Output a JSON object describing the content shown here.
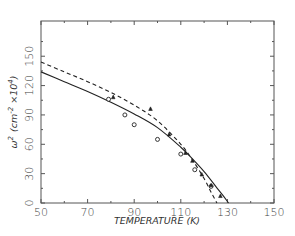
{
  "chart_data": {
    "type": "line",
    "title": "",
    "xlabel": "TEMPERATURE (K)",
    "ylabel": "ω² (cm⁻² ×10⁴)",
    "ylabel_parts": {
      "symbol": "ω",
      "symbol_sup": "2",
      "unit_open": "(cm",
      "unit_sup": "-2",
      "unit_mult": " ×10",
      "unit_mult_sup": "4",
      "unit_close": ")"
    },
    "xlim": [
      50,
      150
    ],
    "ylim": [
      0,
      186
    ],
    "xticks": [
      50,
      70,
      90,
      110,
      130,
      150
    ],
    "xtick_labels": [
      "50",
      "70",
      "90",
      "110",
      "130",
      "150"
    ],
    "xminor_ticks": [
      60,
      80,
      100,
      120,
      140
    ],
    "yticks": [
      0,
      30,
      60,
      90,
      120,
      150
    ],
    "ytick_labels": [
      "0",
      "30",
      "60",
      "90",
      "120",
      "150"
    ],
    "yminor_ticks": [
      15,
      45,
      75,
      105,
      135,
      165
    ],
    "grid": false,
    "legend": null,
    "series": [
      {
        "name": "solid fit",
        "style": "solid",
        "color": "#222222",
        "x": [
          50,
          60,
          70,
          80,
          90,
          100,
          110,
          115,
          120,
          125,
          128,
          130.5
        ],
        "y": [
          134,
          124,
          114,
          103,
          91,
          77,
          57,
          45,
          32,
          17,
          8,
          0
        ]
      },
      {
        "name": "dashed fit",
        "style": "dashed",
        "color": "#222222",
        "x": [
          50,
          60,
          70,
          80,
          90,
          100,
          110,
          115,
          120,
          123,
          125.5
        ],
        "y": [
          144,
          134,
          124,
          113,
          100,
          84,
          60,
          44,
          25,
          11,
          0
        ]
      },
      {
        "name": "circles",
        "style": "marker",
        "marker": "circle",
        "color": "#222222",
        "x": [
          79,
          86,
          90,
          100,
          110,
          116,
          123
        ],
        "y": [
          106,
          90,
          80,
          65,
          50,
          34,
          17
        ]
      },
      {
        "name": "triangles",
        "style": "marker",
        "marker": "triangle",
        "color": "#222222",
        "x": [
          81,
          97,
          105,
          112,
          115,
          119,
          123,
          127
        ],
        "y": [
          108,
          96,
          70,
          51,
          43,
          29,
          18,
          7
        ]
      }
    ]
  },
  "plot_area": {
    "left": 41,
    "top": 21,
    "right": 274,
    "bottom": 203
  }
}
